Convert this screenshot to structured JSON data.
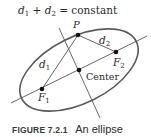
{
  "diagram": {
    "equation": {
      "d1": "d",
      "d1_sub": "1",
      "plus": " + ",
      "d2": "d",
      "d2_sub": "2",
      "rest": " = constant"
    },
    "labels": {
      "P": "P",
      "d1": "d",
      "d1_sub": "1",
      "d2": "d",
      "d2_sub": "2",
      "F1": "F",
      "F1_sub": "1",
      "F2": "F",
      "F2_sub": "2",
      "center": "Center"
    },
    "points": {
      "P": [
        78,
        35
      ],
      "F1": [
        42,
        89
      ],
      "F2": [
        116,
        52
      ],
      "center": [
        79,
        70
      ]
    },
    "ellipse": {
      "cx": 79,
      "cy": 70,
      "rx": 64,
      "ry": 33,
      "rotation_deg": -26.6,
      "stroke": "#555555"
    },
    "line_color": "#444444"
  },
  "caption": {
    "figure_number": "FIGURE 7.2.1",
    "title": "An ellipse"
  }
}
